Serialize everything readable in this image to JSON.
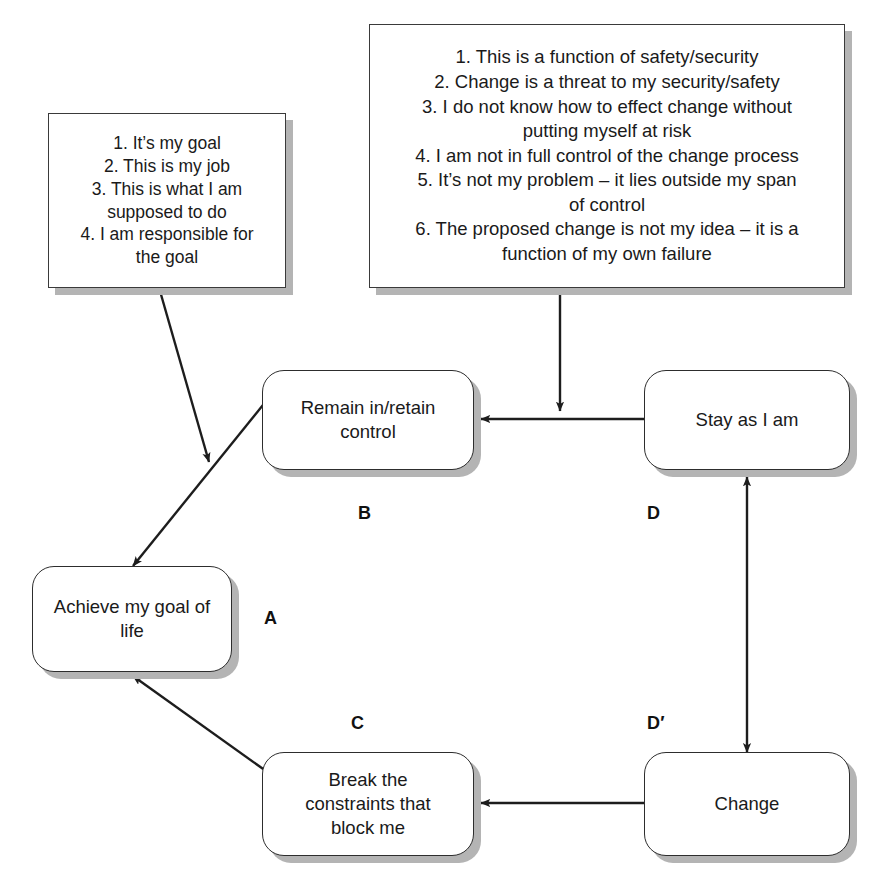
{
  "diagram": {
    "notes": [
      {
        "id": "beliefs-goal",
        "text": "1. It’s my goal\n2. This is my job\n3. This is what I am\nsupposed to do\n4. I am responsible for\nthe goal"
      },
      {
        "id": "beliefs-change",
        "text": "1. This is a function of safety/security\n2. Change is a threat to my security/safety\n3. I do not know how to effect change without\nputting myself at risk\n4. I am not in full control of the change process\n5. It’s not my problem – it lies outside my span\nof control\n6. The proposed change is not my idea – it is a\nfunction of my own failure"
      }
    ],
    "entities": [
      {
        "id": "a",
        "tag": "A",
        "text": "Achieve my goal of\nlife"
      },
      {
        "id": "b",
        "tag": "B",
        "text": "Remain in/retain\ncontrol"
      },
      {
        "id": "c",
        "tag": "C",
        "text": "Break the\nconstraints that\nblock me"
      },
      {
        "id": "d",
        "tag": "D",
        "text": "Stay as I am"
      },
      {
        "id": "dp",
        "tag": "D′",
        "text": "Change"
      }
    ],
    "connections": [
      {
        "from": "b",
        "to": "a",
        "style": "arrow"
      },
      {
        "from": "c",
        "to": "a",
        "style": "arrow"
      },
      {
        "from": "d",
        "to": "b",
        "style": "arrow"
      },
      {
        "from": "dp",
        "to": "c",
        "style": "arrow"
      },
      {
        "from": "d",
        "to": "dp",
        "style": "double-arrow"
      },
      {
        "from": "beliefs-goal",
        "to": "b-a-edge",
        "style": "arrow"
      },
      {
        "from": "beliefs-change",
        "to": "d-b-edge",
        "style": "arrow"
      }
    ],
    "colors": {
      "stroke": "#2d2d2d",
      "shadow": "#b4b4b4",
      "background": "#ffffff",
      "text": "#1a1a1a"
    }
  }
}
